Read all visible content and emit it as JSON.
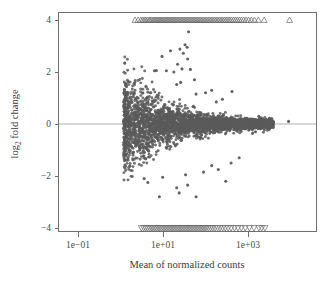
{
  "figure": {
    "kind": "ma-plot",
    "background_color": "#ffffff"
  },
  "chart_data": {
    "type": "scatter",
    "title": "",
    "subtitle": "",
    "xlabel": "Mean of normalized counts",
    "ylabel": "log2 fold change",
    "ylabel_base": "log",
    "ylabel_sub": "2",
    "ylabel_rest": " fold change",
    "xscale": "log10",
    "yscale": "linear",
    "xlim": [
      0.02,
      100000
    ],
    "ylim": [
      -4.3,
      4.3
    ],
    "grid": false,
    "legend": null,
    "legend_position": "none",
    "point_color": "#5b5b5b",
    "point_radius": 1.5,
    "zero_line": {
      "y": 0,
      "color": "#c9c9c9",
      "width": 1.6
    },
    "clipped_marker": {
      "up_symbol": "triangle-up",
      "down_symbol": "triangle-down",
      "color": "#6a6a6a",
      "value_up": 4,
      "value_down": -4
    },
    "xticks": [
      0.1,
      10,
      1000
    ],
    "xticklabels": [
      "1e−01",
      "1e+01",
      "1e+03"
    ],
    "yticks": [
      4,
      2,
      0,
      -2,
      -4
    ],
    "yticklabels": [
      "4",
      "2",
      "0",
      "−2",
      "−4"
    ],
    "n_points_approx": 2400,
    "clipped_up_x": [
      2.2,
      2.6,
      3.0,
      3.3,
      3.6,
      3.9,
      4.3,
      4.7,
      5.0,
      5.4,
      5.9,
      6.3,
      6.8,
      7.2,
      7.8,
      8.3,
      8.9,
      9.5,
      10.2,
      11.0,
      11.8,
      12.6,
      13.5,
      14.5,
      15.6,
      16.8,
      18.0,
      19.4,
      20.8,
      22.4,
      24.1,
      26.0,
      28.0,
      30.1,
      32.5,
      35.0,
      37.7,
      40.7,
      44.0,
      47.5,
      51.3,
      55.5,
      60.0,
      65.0,
      70.5,
      76.5,
      83.0,
      90.0,
      98.0,
      106,
      116,
      126,
      137,
      150,
      163,
      178,
      195,
      213,
      233,
      255,
      280,
      307,
      338,
      372,
      410,
      455,
      505,
      560,
      625,
      700,
      790,
      900,
      1030,
      1200,
      1420,
      1750,
      2400,
      9500
    ],
    "clipped_down_x": [
      3.1,
      3.5,
      3.9,
      4.3,
      4.8,
      5.3,
      5.8,
      6.4,
      7.0,
      7.7,
      8.4,
      9.2,
      10.1,
      11.0,
      12.0,
      13.1,
      14.3,
      15.6,
      17.0,
      18.5,
      20.2,
      22.0,
      24.0,
      26.2,
      28.6,
      31.2,
      34.0,
      37.1,
      40.5,
      44.2,
      48.2,
      52.6,
      57.4,
      62.6,
      68.3,
      74.6,
      81.4,
      88.8,
      97.0,
      106,
      118,
      132,
      148,
      168,
      192,
      220,
      253,
      292,
      340,
      400,
      480,
      580,
      700,
      860,
      1080,
      1380,
      1800,
      2100,
      2500
    ],
    "outliers_upper": [
      {
        "x": 40,
        "y": 3.55
      },
      {
        "x": 33,
        "y": 3.05
      },
      {
        "x": 37,
        "y": 2.95
      },
      {
        "x": 25,
        "y": 2.88
      },
      {
        "x": 30,
        "y": 2.72
      },
      {
        "x": 15,
        "y": 2.82
      },
      {
        "x": 9.5,
        "y": 2.6
      },
      {
        "x": 38,
        "y": 2.5
      },
      {
        "x": 22,
        "y": 2.3
      },
      {
        "x": 28,
        "y": 2.12
      },
      {
        "x": 44,
        "y": 2.1
      },
      {
        "x": 12,
        "y": 2.05
      },
      {
        "x": 6.3,
        "y": 2.05
      },
      {
        "x": 7.0,
        "y": 2.06
      },
      {
        "x": 18,
        "y": 2.0
      },
      {
        "x": 55,
        "y": 1.7
      },
      {
        "x": 26,
        "y": 1.6
      },
      {
        "x": 21,
        "y": 1.52
      },
      {
        "x": 140,
        "y": 1.3
      },
      {
        "x": 420,
        "y": 1.25
      },
      {
        "x": 100,
        "y": 1.2
      },
      {
        "x": 60,
        "y": 1.15
      },
      {
        "x": 250,
        "y": 0.95
      },
      {
        "x": 180,
        "y": 0.85
      }
    ],
    "outliers_lower": [
      {
        "x": 8.2,
        "y": -2.8
      },
      {
        "x": 60,
        "y": -2.8
      },
      {
        "x": 24,
        "y": -2.65
      },
      {
        "x": 21,
        "y": -2.45
      },
      {
        "x": 38,
        "y": -2.35
      },
      {
        "x": 300,
        "y": -2.2
      },
      {
        "x": 4.4,
        "y": -2.25
      },
      {
        "x": 3.6,
        "y": -2.1
      },
      {
        "x": 9.8,
        "y": -2.05
      },
      {
        "x": 90,
        "y": -1.85
      },
      {
        "x": 200,
        "y": -1.75
      },
      {
        "x": 140,
        "y": -1.6
      },
      {
        "x": 400,
        "y": -1.5
      },
      {
        "x": 620,
        "y": -1.3
      },
      {
        "x": 34,
        "y": -1.95
      }
    ],
    "isolated_right": [
      {
        "x": 3200,
        "y": 0.22
      },
      {
        "x": 9000,
        "y": 0.1
      },
      {
        "x": 2000,
        "y": -0.1
      },
      {
        "x": 2600,
        "y": 0.05
      },
      {
        "x": 1800,
        "y": 0.3
      },
      {
        "x": 1500,
        "y": -0.3
      }
    ]
  }
}
